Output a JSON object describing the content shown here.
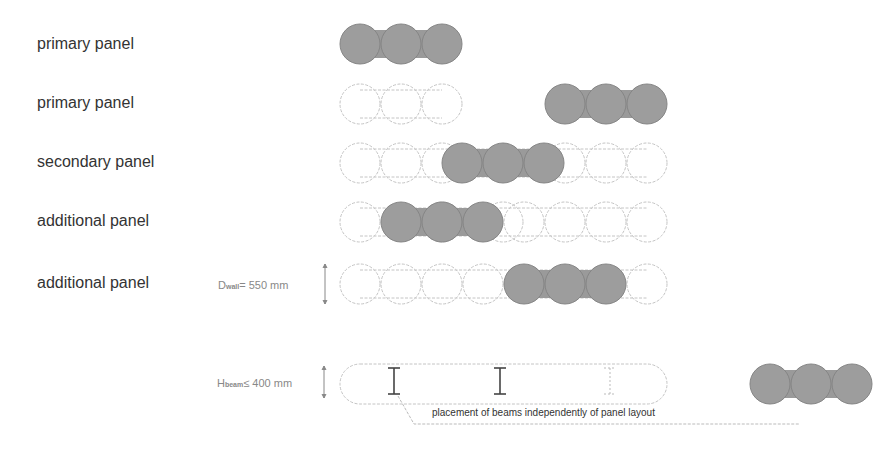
{
  "rows": [
    {
      "label": "primary panel",
      "y": 44
    },
    {
      "label": "primary panel",
      "y": 104
    },
    {
      "label": "secondary panel",
      "y": 163
    },
    {
      "label": "additional panel",
      "y": 222
    },
    {
      "label": "additional panel",
      "y": 284
    }
  ],
  "dimensions": {
    "wall_prefix": "D",
    "wall_sub": "wall",
    "wall_value": "= 550 mm",
    "beam_prefix": "H",
    "beam_sub": "beam",
    "beam_value": "≤ 400 mm"
  },
  "note": "placement of beams independently of panel layout",
  "colors": {
    "filled": "#9a9a9a",
    "filled_stroke": "#7a7a7a",
    "outline": "#bdbdbd"
  }
}
